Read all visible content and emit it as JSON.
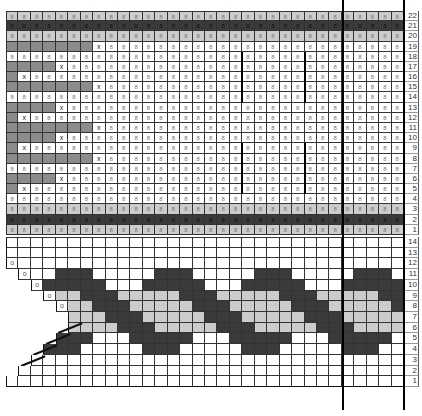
{
  "colors": {
    "white": "#ffffff",
    "light": "#cccccc",
    "mid": "#8c8c8c",
    "dark": "#3a3a3a",
    "grid": "#333333"
  },
  "upper_chart": {
    "columns": 32,
    "rows": 22,
    "row_labels": [
      "22",
      "21",
      "20",
      "19",
      "18",
      "17",
      "16",
      "15",
      "14",
      "13",
      "12",
      "11",
      "10",
      "9",
      "8",
      "7",
      "6",
      "5",
      "4",
      "3",
      "2",
      "1"
    ],
    "cell_symbol": "8",
    "x_symbol": "x",
    "special_rows": {
      "22": "light",
      "21": "dark",
      "20": "light",
      "3": "light",
      "2": "dark",
      "1": "light"
    },
    "left_gray_pattern": [
      {
        "row": 19,
        "gray_cols": 7,
        "x_col": 8
      },
      {
        "row": 17,
        "gray_cols": 4,
        "x_col": 5
      },
      {
        "row": 16,
        "gray_cols": 1,
        "x_col": 2
      },
      {
        "row": 15,
        "gray_cols": 7,
        "x_col": 8
      },
      {
        "row": 13,
        "gray_cols": 4,
        "x_col": 5
      },
      {
        "row": 12,
        "gray_cols": 1,
        "x_col": 2
      },
      {
        "row": 11,
        "gray_cols": 7,
        "x_col": 8
      },
      {
        "row": 10,
        "gray_cols": 4,
        "x_col": 5
      },
      {
        "row": 9,
        "gray_cols": 1,
        "x_col": 2
      },
      {
        "row": 8,
        "gray_cols": 7,
        "x_col": 8
      },
      {
        "row": 6,
        "gray_cols": 4,
        "x_col": 5
      },
      {
        "row": 5,
        "gray_cols": 1,
        "x_col": 2
      }
    ]
  },
  "lower_chart": {
    "columns": 32,
    "rows": 14,
    "row_labels": [
      "14",
      "13",
      "12",
      "11",
      "10",
      "9",
      "8",
      "7",
      "6",
      "5",
      "4",
      "3",
      "2",
      "1"
    ],
    "start_col": {
      "14": 1,
      "13": 1,
      "12": 1,
      "11": 2,
      "10": 3,
      "9": 4,
      "8": 5,
      "7": 6,
      "6": 6,
      "5": 5,
      "4": 4,
      "3": 3,
      "2": 2,
      "1": 1
    },
    "o_marks": {
      "12": 1,
      "11": 2,
      "10": 3,
      "9": 4,
      "8": 5
    },
    "slash_rows": [
      "6",
      "5",
      "4",
      "3"
    ],
    "cable_period": 8,
    "dark_cols_base": {
      "11": [
        5,
        6,
        7
      ],
      "10": [
        4,
        5,
        6,
        7,
        8
      ],
      "9": [
        7,
        8,
        9
      ],
      "8": [
        8,
        9,
        10
      ],
      "7": [
        9,
        10,
        11
      ],
      "6": [
        10,
        11,
        12
      ],
      "5": [
        3,
        4,
        5,
        6,
        7
      ],
      "4": [
        4,
        5,
        6
      ]
    },
    "light_rows": [
      "9",
      "8",
      "7",
      "6"
    ]
  },
  "vertical_rules": [
    {
      "x": 343,
      "y1": 0,
      "y2": 410
    },
    {
      "x": 404,
      "y1": 0,
      "y2": 410
    }
  ],
  "short_rules": [
    {
      "col_edge": 19,
      "from_row": 18,
      "to_row": 14
    },
    {
      "col_edge": 24,
      "from_row": 18,
      "to_row": 14
    },
    {
      "col_edge": 19,
      "from_row": 9,
      "to_row": 5
    },
    {
      "col_edge": 24,
      "from_row": 9,
      "to_row": 5
    }
  ]
}
